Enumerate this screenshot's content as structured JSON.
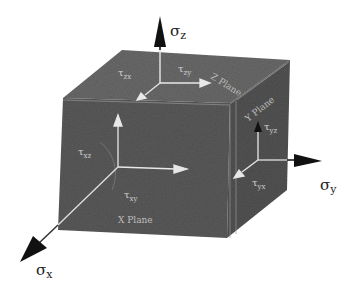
{
  "diagram": {
    "type": "3d-stress-element-cube",
    "colors": {
      "cube_face_front": "#555555",
      "cube_face_top": "#5e5e5e",
      "cube_face_right": "#4f4f4f",
      "edge_highlight": "#9a9a9a",
      "arrow": "#111111",
      "inner_arrow": "#e8e8e8",
      "background": "#ffffff"
    },
    "axes": {
      "z": {
        "label_sigma": "σ",
        "label_sub": "z"
      },
      "y": {
        "label_sigma": "σ",
        "label_sub": "y"
      },
      "x": {
        "label_sigma": "σ",
        "label_sub": "x"
      }
    },
    "shear_labels": {
      "top_left": {
        "tau": "τ",
        "sub": "zx"
      },
      "top_right": {
        "tau": "τ",
        "sub": "zy"
      },
      "front_left": {
        "tau": "τ",
        "sub": "xz"
      },
      "front_bottom": {
        "tau": "τ",
        "sub": "xy"
      },
      "right_top": {
        "tau": "τ",
        "sub": "yz"
      },
      "right_bottom": {
        "tau": "τ",
        "sub": "yx"
      }
    },
    "face_labels": {
      "top": "Z Plane",
      "right": "Y Plane",
      "front": "X Plane"
    }
  }
}
